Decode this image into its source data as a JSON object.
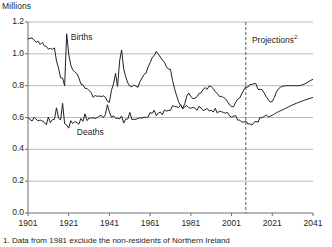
{
  "chart_data": {
    "type": "line",
    "title": "",
    "ylabel": "Millions",
    "xlabel": "",
    "ylim": [
      0.0,
      1.2
    ],
    "xlim": [
      1901,
      2041
    ],
    "grid": true,
    "legend_position": "inline-annotation",
    "yticks": [
      "0.0",
      "0.2",
      "0.4",
      "0.6",
      "0.8",
      "1.0",
      "1.2"
    ],
    "ytick_values": [
      0.0,
      0.2,
      0.4,
      0.6,
      0.8,
      1.0,
      1.2
    ],
    "xticks": [
      "1901",
      "1921",
      "1941",
      "1961",
      "1981",
      "2001",
      "2021",
      "2041"
    ],
    "xtick_values": [
      1901,
      1921,
      1941,
      1961,
      1981,
      2001,
      2021,
      2041
    ],
    "annotations": [
      {
        "name": "births-label",
        "text": "Births",
        "x": 1922,
        "y": 1.1
      },
      {
        "name": "deaths-label",
        "text": "Deaths",
        "x": 1925,
        "y": 0.5
      },
      {
        "name": "projections-label",
        "text": "Projections",
        "superscript": "2",
        "x": 2011,
        "y": 1.085
      }
    ],
    "projection_divider": {
      "x": 2008,
      "style": "dashed"
    },
    "series": [
      {
        "name": "Births",
        "x": [
          1901,
          1902,
          1903,
          1904,
          1905,
          1906,
          1907,
          1908,
          1909,
          1910,
          1911,
          1912,
          1913,
          1914,
          1915,
          1916,
          1917,
          1918,
          1919,
          1920,
          1921,
          1922,
          1923,
          1924,
          1925,
          1926,
          1927,
          1928,
          1929,
          1930,
          1931,
          1932,
          1933,
          1934,
          1935,
          1936,
          1937,
          1938,
          1939,
          1940,
          1941,
          1942,
          1943,
          1944,
          1945,
          1946,
          1947,
          1948,
          1949,
          1950,
          1951,
          1952,
          1953,
          1954,
          1955,
          1956,
          1957,
          1958,
          1959,
          1960,
          1961,
          1962,
          1963,
          1964,
          1965,
          1966,
          1967,
          1968,
          1969,
          1970,
          1971,
          1972,
          1973,
          1974,
          1975,
          1976,
          1977,
          1978,
          1979,
          1980,
          1981,
          1982,
          1983,
          1984,
          1985,
          1986,
          1987,
          1988,
          1989,
          1990,
          1991,
          1992,
          1993,
          1994,
          1995,
          1996,
          1997,
          1998,
          1999,
          2000,
          2001,
          2002,
          2003,
          2004,
          2005,
          2006,
          2007,
          2008,
          2009,
          2010,
          2011,
          2012,
          2013,
          2014,
          2015,
          2016,
          2017,
          2018,
          2019,
          2020,
          2021,
          2022,
          2023,
          2024,
          2025,
          2026,
          2027,
          2028,
          2029,
          2030,
          2031,
          2032,
          2033,
          2034,
          2035,
          2036,
          2037,
          2038,
          2039,
          2040,
          2041
        ],
        "values": [
          1.093,
          1.098,
          1.1,
          1.085,
          1.073,
          1.079,
          1.059,
          1.072,
          1.05,
          1.047,
          1.03,
          1.034,
          1.028,
          1.037,
          0.954,
          0.91,
          0.85,
          0.848,
          0.799,
          1.126,
          0.998,
          0.929,
          0.899,
          0.886,
          0.876,
          0.848,
          0.81,
          0.805,
          0.783,
          0.783,
          0.769,
          0.757,
          0.727,
          0.738,
          0.733,
          0.735,
          0.731,
          0.736,
          0.727,
          0.702,
          0.696,
          0.771,
          0.811,
          0.878,
          0.795,
          0.955,
          1.025,
          0.905,
          0.856,
          0.818,
          0.797,
          0.793,
          0.804,
          0.797,
          0.789,
          0.825,
          0.848,
          0.87,
          0.879,
          0.918,
          0.944,
          0.975,
          0.99,
          1.015,
          0.997,
          0.98,
          0.962,
          0.947,
          0.92,
          0.904,
          0.902,
          0.834,
          0.78,
          0.737,
          0.698,
          0.676,
          0.657,
          0.687,
          0.735,
          0.754,
          0.731,
          0.719,
          0.721,
          0.73,
          0.751,
          0.755,
          0.776,
          0.788,
          0.777,
          0.799,
          0.793,
          0.781,
          0.762,
          0.751,
          0.732,
          0.733,
          0.726,
          0.717,
          0.7,
          0.679,
          0.669,
          0.668,
          0.696,
          0.716,
          0.722,
          0.749,
          0.772,
          0.794,
          0.79,
          0.807,
          0.808,
          0.813,
          0.812,
          0.776,
          0.777,
          0.774,
          0.755,
          0.731,
          0.713,
          0.697,
          0.7,
          0.725,
          0.76,
          0.78,
          0.79,
          0.796,
          0.798,
          0.8,
          0.8,
          0.8,
          0.8,
          0.8,
          0.8,
          0.8,
          0.802,
          0.806,
          0.812,
          0.818,
          0.826,
          0.834,
          0.84
        ]
      },
      {
        "name": "Deaths",
        "x": [
          1901,
          1902,
          1903,
          1904,
          1905,
          1906,
          1907,
          1908,
          1909,
          1910,
          1911,
          1912,
          1913,
          1914,
          1915,
          1916,
          1917,
          1918,
          1919,
          1920,
          1921,
          1922,
          1923,
          1924,
          1925,
          1926,
          1927,
          1928,
          1929,
          1930,
          1931,
          1932,
          1933,
          1934,
          1935,
          1936,
          1937,
          1938,
          1939,
          1940,
          1941,
          1942,
          1943,
          1944,
          1945,
          1946,
          1947,
          1948,
          1949,
          1950,
          1951,
          1952,
          1953,
          1954,
          1955,
          1956,
          1957,
          1958,
          1959,
          1960,
          1961,
          1962,
          1963,
          1964,
          1965,
          1966,
          1967,
          1968,
          1969,
          1970,
          1971,
          1972,
          1973,
          1974,
          1975,
          1976,
          1977,
          1978,
          1979,
          1980,
          1981,
          1982,
          1983,
          1984,
          1985,
          1986,
          1987,
          1988,
          1989,
          1990,
          1991,
          1992,
          1993,
          1994,
          1995,
          1996,
          1997,
          1998,
          1999,
          2000,
          2001,
          2002,
          2003,
          2004,
          2005,
          2006,
          2007,
          2008,
          2009,
          2010,
          2011,
          2012,
          2013,
          2014,
          2015,
          2016,
          2017,
          2018,
          2019,
          2020,
          2021,
          2022,
          2023,
          2024,
          2025,
          2026,
          2027,
          2028,
          2029,
          2030,
          2031,
          2032,
          2033,
          2034,
          2035,
          2036,
          2037,
          2038,
          2039,
          2040,
          2041
        ],
        "values": [
          0.598,
          0.588,
          0.578,
          0.601,
          0.589,
          0.579,
          0.584,
          0.578,
          0.57,
          0.554,
          0.603,
          0.568,
          0.586,
          0.589,
          0.661,
          0.597,
          0.584,
          0.689,
          0.561,
          0.552,
          0.533,
          0.58,
          0.562,
          0.575,
          0.568,
          0.558,
          0.594,
          0.576,
          0.623,
          0.58,
          0.597,
          0.596,
          0.598,
          0.594,
          0.599,
          0.608,
          0.614,
          0.598,
          0.618,
          0.68,
          0.634,
          0.601,
          0.611,
          0.594,
          0.596,
          0.591,
          0.61,
          0.565,
          0.59,
          0.59,
          0.632,
          0.588,
          0.589,
          0.588,
          0.595,
          0.598,
          0.596,
          0.602,
          0.6,
          0.603,
          0.632,
          0.625,
          0.646,
          0.611,
          0.628,
          0.634,
          0.617,
          0.647,
          0.64,
          0.644,
          0.645,
          0.674,
          0.67,
          0.667,
          0.662,
          0.68,
          0.655,
          0.667,
          0.675,
          0.662,
          0.658,
          0.663,
          0.659,
          0.645,
          0.67,
          0.66,
          0.644,
          0.649,
          0.657,
          0.641,
          0.646,
          0.634,
          0.658,
          0.627,
          0.641,
          0.636,
          0.632,
          0.627,
          0.632,
          0.61,
          0.602,
          0.608,
          0.612,
          0.584,
          0.583,
          0.572,
          0.571,
          0.579,
          0.559,
          0.561,
          0.552,
          0.569,
          0.576,
          0.57,
          0.602,
          0.597,
          0.607,
          0.616,
          0.604,
          0.608,
          0.614,
          0.622,
          0.63,
          0.636,
          0.642,
          0.648,
          0.654,
          0.661,
          0.667,
          0.673,
          0.679,
          0.685,
          0.69,
          0.695,
          0.7,
          0.705,
          0.71,
          0.714,
          0.718,
          0.722,
          0.726
        ]
      }
    ]
  },
  "footnote": {
    "marker": "1.",
    "text": "Data from 1981 exclude the non-residents of Northern Ireland"
  },
  "colors": {
    "line": "#231f20",
    "grid": "#a7a9ac",
    "axis": "#6d6e71",
    "text": "#231f20"
  }
}
